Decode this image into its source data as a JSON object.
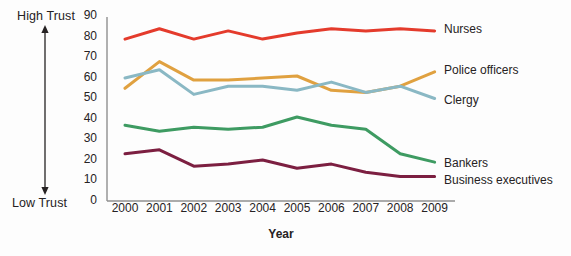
{
  "annotations": {
    "high_trust": "High Trust",
    "low_trust": "Low Trust"
  },
  "chart_data": {
    "type": "line",
    "title": "",
    "xlabel": "Year",
    "ylabel": "",
    "x": [
      "2000",
      "2001",
      "2002",
      "2003",
      "2004",
      "2005",
      "2006",
      "2007",
      "2008",
      "2009"
    ],
    "yticks": [
      0,
      10,
      20,
      30,
      40,
      50,
      60,
      70,
      80,
      90
    ],
    "ylim": [
      0,
      90
    ],
    "grid": false,
    "legend_position": "right-of-line-ends",
    "series": [
      {
        "name": "Nurses",
        "color": "#e43b2c",
        "values": [
          79,
          84,
          79,
          83,
          79,
          82,
          84,
          83,
          84,
          83
        ]
      },
      {
        "name": "Police officers",
        "color": "#e0a140",
        "values": [
          55,
          68,
          59,
          59,
          60,
          61,
          54,
          53,
          56,
          63
        ]
      },
      {
        "name": "Clergy",
        "color": "#8ab8c4",
        "values": [
          60,
          64,
          52,
          56,
          56,
          54,
          58,
          53,
          56,
          50
        ]
      },
      {
        "name": "Bankers",
        "color": "#3e9b62",
        "values": [
          37,
          34,
          36,
          35,
          36,
          41,
          37,
          35,
          23,
          19
        ]
      },
      {
        "name": "Business executives",
        "color": "#7c1f41",
        "values": [
          23,
          25,
          17,
          18,
          20,
          16,
          18,
          14,
          12,
          12
        ]
      }
    ],
    "colors": {
      "axis": "#8f8f8f",
      "text": "#262223"
    }
  }
}
